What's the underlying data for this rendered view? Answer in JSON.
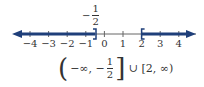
{
  "number_line": {
    "min": -4.7,
    "max": 4.7,
    "ticks": [
      "−4",
      "−3",
      "−2",
      "−1",
      "0",
      "1",
      "2",
      "3",
      "4"
    ],
    "tick_values": [
      -4,
      -3,
      -2,
      -1,
      0,
      1,
      2,
      3,
      4
    ],
    "shaded_color": "#1f3f7a",
    "axis_color": "#555555",
    "intervals": [
      {
        "from": "-inf",
        "to": -0.5,
        "right_endpoint": "closed ]"
      },
      {
        "from": 2,
        "to": "inf",
        "left_endpoint": "closed ["
      }
    ]
  },
  "marker_label": {
    "sign": "−",
    "numerator": "1",
    "denominator": "2"
  },
  "interval_notation": {
    "open_paren": "(",
    "part1": "−∞, −",
    "numerator": "1",
    "denominator": "2",
    "close_bracket": "]",
    "union": " ∪ ",
    "part2": "[2, ∞)"
  }
}
